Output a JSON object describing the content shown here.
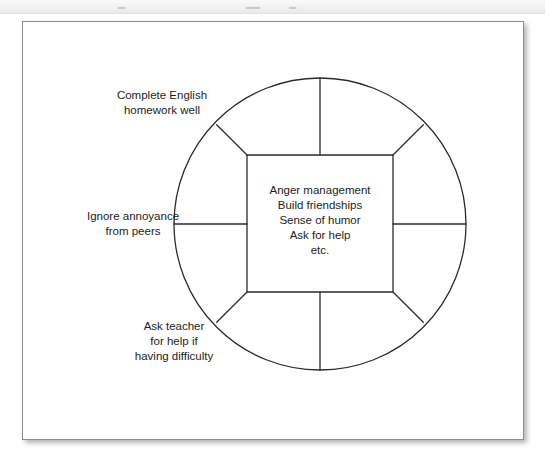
{
  "window": {
    "top_strip": {
      "glyphs": [
        {
          "name": "toolbar-glyph-1",
          "char": "▬",
          "x": 118
        },
        {
          "name": "toolbar-glyph-2",
          "char": "▬▬",
          "x": 246
        },
        {
          "name": "toolbar-glyph-3",
          "char": "▬",
          "x": 289
        }
      ]
    }
  },
  "diagram": {
    "type": "circle-wheel-with-inscribed-square",
    "center_panel": {
      "name": "core-skills-box",
      "lines": [
        "Anger management",
        "Build friendships",
        "Sense of humor",
        "Ask for help",
        "etc."
      ],
      "text": "Anger management\nBuild friendships\nSense of humor\nAsk for help\netc."
    },
    "outer_labels": [
      {
        "id": "top-left",
        "name": "label-complete-english-homework",
        "lines": [
          "Complete English",
          "homework well"
        ],
        "text": "Complete English\nhomework well"
      },
      {
        "id": "left",
        "name": "label-ignore-annoyance-from-peers",
        "lines": [
          "Ignore annoyance",
          "from peers"
        ],
        "text": "Ignore annoyance\nfrom peers"
      },
      {
        "id": "bottom-left",
        "name": "label-ask-teacher-for-help",
        "lines": [
          "Ask teacher",
          "for help if",
          "having difficulty"
        ],
        "text": "Ask teacher\nfor help if\nhaving difficulty"
      }
    ],
    "geometry": {
      "circle": {
        "cx": 320,
        "cy": 224,
        "r": 146
      },
      "square": {
        "x": 247,
        "y": 155,
        "width": 146,
        "height": 137
      },
      "stroke_color": "#2b2b2b",
      "stroke_width": 1.3,
      "fill": "#ffffff"
    },
    "colors": {
      "line": "#2b2b2b",
      "text": "#1d1d1d",
      "frame_border": "#8d8d8d",
      "page_background": "#ffffff",
      "strip_background": "#f2f2f2"
    }
  }
}
